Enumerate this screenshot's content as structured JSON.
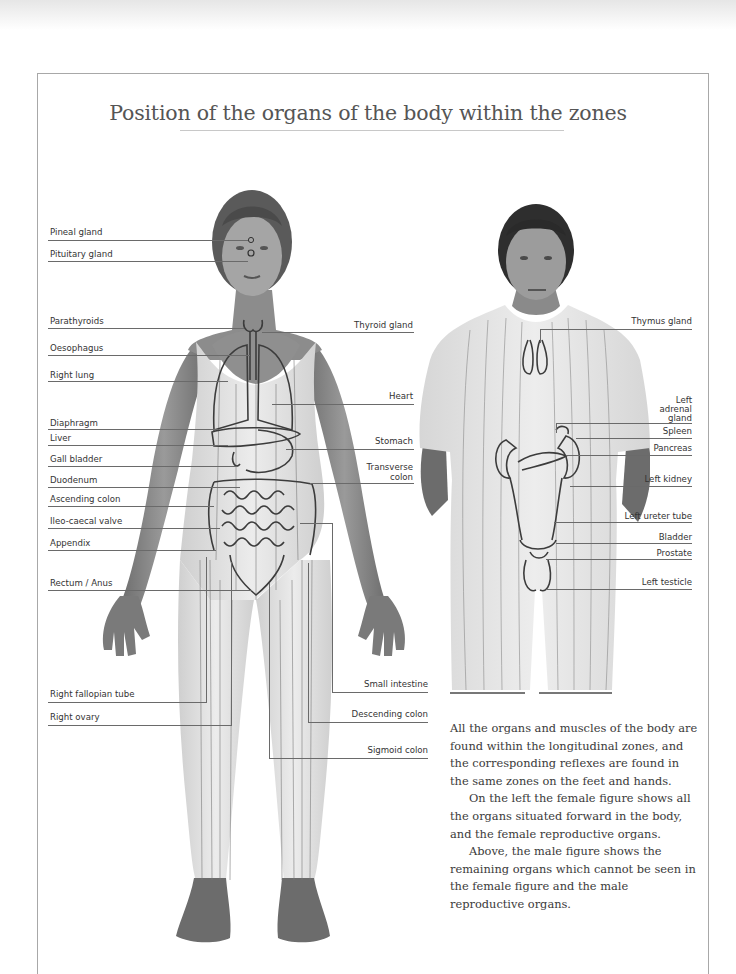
{
  "title": "Position of the organs of the body within the zones",
  "female_figure": {
    "left_labels": [
      {
        "text": "Pineal gland",
        "y": 232
      },
      {
        "text": "Pituitary gland",
        "y": 253
      },
      {
        "text": "Parathyroids",
        "y": 321
      },
      {
        "text": "Oesophagus",
        "y": 347
      },
      {
        "text": "Right lung",
        "y": 374
      },
      {
        "text": "Diaphragm",
        "y": 423
      },
      {
        "text": "Liver",
        "y": 437
      },
      {
        "text": "Gall bladder",
        "y": 459
      },
      {
        "text": "Duodenum",
        "y": 480
      },
      {
        "text": "Ascending colon",
        "y": 499
      },
      {
        "text": "Ileo-caecal valve",
        "y": 521
      },
      {
        "text": "Appendix",
        "y": 543
      },
      {
        "text": "Rectum / Anus",
        "y": 583
      },
      {
        "text": "Right fallopian tube",
        "y": 694
      },
      {
        "text": "Right ovary",
        "y": 717
      }
    ],
    "right_labels": [
      {
        "text": "Thyroid gland",
        "y": 325
      },
      {
        "text": "Heart",
        "y": 396
      },
      {
        "text": "Stomach",
        "y": 441
      },
      {
        "text": "Transverse colon",
        "y": 465
      },
      {
        "text": "Small intestine",
        "y": 684
      },
      {
        "text": "Descending colon",
        "y": 714
      },
      {
        "text": "Sigmoid colon",
        "y": 750
      }
    ]
  },
  "male_figure": {
    "right_labels": [
      {
        "text": "Thymus gland",
        "y": 321
      },
      {
        "text": "Left adrenal gland",
        "y": 397
      },
      {
        "text": "Spleen",
        "y": 431
      },
      {
        "text": "Pancreas",
        "y": 448
      },
      {
        "text": "Left kidney",
        "y": 479
      },
      {
        "text": "Left ureter tube",
        "y": 516
      },
      {
        "text": "Bladder",
        "y": 537
      },
      {
        "text": "Prostate",
        "y": 553
      },
      {
        "text": "Left testicle",
        "y": 582
      }
    ]
  },
  "body_text": {
    "p1": "All the organs and muscles of the body are found within the longitudinal zones, and the corresponding reflexes are found in the same zones on the feet and hands.",
    "p2": "On the left the female figure shows all the organs situated forward in the body, and the female reproductive organs.",
    "p3": "Above, the male figure shows the remaining organs which cannot be seen in the female figure and the male reproductive organs."
  },
  "labels_left_text": {
    "pineal": "Pineal gland",
    "pituitary": "Pituitary gland",
    "parathyroids": "Parathyroids",
    "oesophagus": "Oesophagus",
    "right_lung": "Right lung",
    "diaphragm": "Diaphragm",
    "liver": "Liver",
    "gall_bladder": "Gall bladder",
    "duodenum": "Duodenum",
    "ascending_colon": "Ascending colon",
    "ileo_caecal": "Ileo-caecal valve",
    "appendix": "Appendix",
    "rectum": "Rectum / Anus",
    "fallopian": "Right fallopian tube",
    "ovary": "Right ovary"
  },
  "labels_mid_text": {
    "thyroid": "Thyroid gland",
    "heart": "Heart",
    "stomach": "Stomach",
    "transverse_1": "Transverse",
    "transverse_2": "colon",
    "small_intestine": "Small intestine",
    "descending_colon": "Descending colon",
    "sigmoid_colon": "Sigmoid colon"
  },
  "labels_male_text": {
    "thymus": "Thymus gland",
    "adrenal_1": "Left",
    "adrenal_2": "adrenal",
    "adrenal_3": "gland",
    "spleen": "Spleen",
    "pancreas": "Pancreas",
    "left_kidney": "Left kidney",
    "ureter": "Left ureter tube",
    "bladder": "Bladder",
    "prostate": "Prostate",
    "testicle": "Left testicle"
  },
  "colors": {
    "skin": "#8a8a8a",
    "garment": "#e4e4e4",
    "organ_line": "#3c3c3c",
    "label_text": "#333333",
    "frame": "#a8a8a8"
  }
}
